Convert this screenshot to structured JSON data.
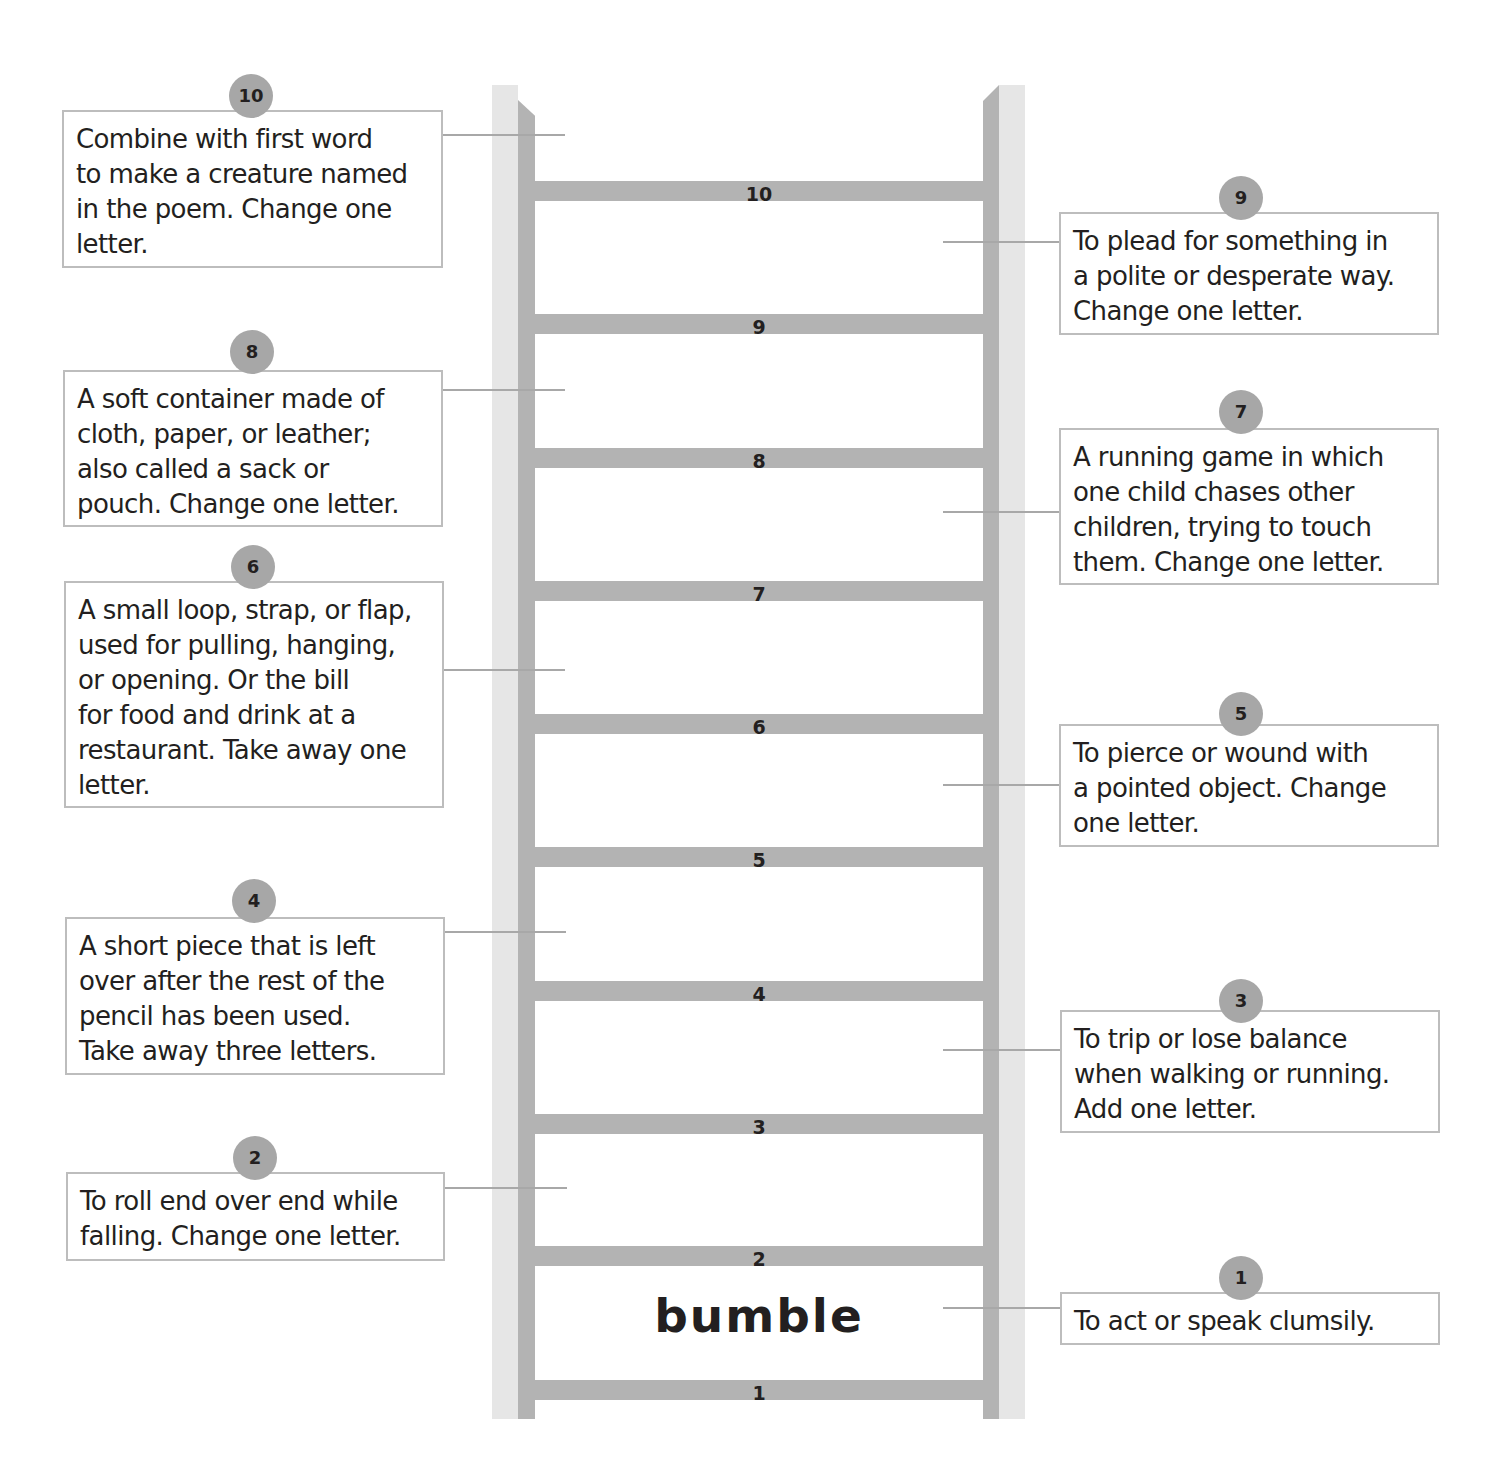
{
  "ladder": {
    "start_word": "bumble",
    "rungs": [
      "1",
      "2",
      "3",
      "4",
      "5",
      "6",
      "7",
      "8",
      "9",
      "10"
    ]
  },
  "clues": [
    {
      "number": "1",
      "text": "To act or speak clumsily."
    },
    {
      "number": "2",
      "text": "To roll end over end while\nfalling.  Change one letter."
    },
    {
      "number": "3",
      "text": "To trip or lose balance\nwhen walking or running.\nAdd one letter."
    },
    {
      "number": "4",
      "text": "A short piece that is left\nover after the rest of the\npencil has been used.\nTake away three letters."
    },
    {
      "number": "5",
      "text": "To pierce or wound with\na pointed object.  Change\none letter."
    },
    {
      "number": "6",
      "text": "A small loop, strap, or flap,\nused for pulling, hanging,\nor opening.  Or the bill\nfor food and drink at a\nrestaurant.  Take away one\nletter."
    },
    {
      "number": "7",
      "text": "A running game in which\none child chases other\nchildren, trying to touch\nthem.  Change one letter."
    },
    {
      "number": "8",
      "text": "A soft container made of\ncloth, paper, or leather;\nalso called a sack or\npouch.  Change one letter."
    },
    {
      "number": "9",
      "text": "To plead for something in\na polite or desperate way.\nChange one letter."
    },
    {
      "number": "10",
      "text": "Combine with first word\nto make a creature named\nin the poem.  Change one\nletter."
    }
  ],
  "colors": {
    "rail_light": "#e6e6e6",
    "rail_dark": "#b3b3b3",
    "badge": "#a7a7a7",
    "box_border": "#bdbdbd",
    "text": "#231f20"
  }
}
